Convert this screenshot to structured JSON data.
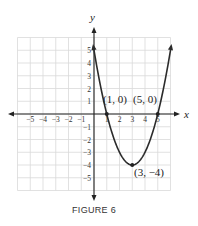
{
  "caption": "FIGURE 6",
  "axes": {
    "x_label": "x",
    "y_label": "y"
  },
  "points": [
    {
      "label": "(1, 0)",
      "x": 1,
      "y": 0
    },
    {
      "label": "(5, 0)",
      "x": 5,
      "y": 0
    },
    {
      "label": "(3, −4)",
      "x": 3,
      "y": -4
    }
  ],
  "chart_data": {
    "type": "line",
    "title": "FIGURE 6",
    "xlabel": "x",
    "ylabel": "y",
    "function": "y = (x - 3)^2 - 4 = x^2 - 6x + 5",
    "x_ticks": [
      -5,
      -4,
      -3,
      -2,
      -1,
      1,
      2,
      3,
      4,
      5
    ],
    "y_ticks": [
      -5,
      -4,
      -3,
      -2,
      -1,
      1,
      2,
      3,
      4,
      5
    ],
    "xlim": [
      -6,
      6
    ],
    "ylim": [
      -6,
      6
    ],
    "grid": true,
    "series": [
      {
        "name": "parabola",
        "x": [
          0,
          0.5,
          1,
          1.5,
          2,
          2.5,
          3,
          3.5,
          4,
          4.5,
          5,
          5.5,
          6
        ],
        "y": [
          5,
          2.25,
          0,
          -1.75,
          -3,
          -3.75,
          -4,
          -3.75,
          -3,
          -1.75,
          0,
          2.25,
          5
        ]
      }
    ],
    "annotations": [
      {
        "text": "(1, 0)",
        "x": 1,
        "y": 0
      },
      {
        "text": "(5, 0)",
        "x": 5,
        "y": 0
      },
      {
        "text": "(3, −4)",
        "x": 3,
        "y": -4
      }
    ]
  }
}
